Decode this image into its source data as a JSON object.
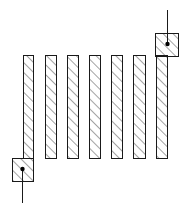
{
  "diagram": {
    "type": "interdigitated-resistor-layout",
    "colors": {
      "stroke": "#1a1a1a",
      "hatch": "#333333",
      "background": "#ffffff"
    },
    "bars": [
      {
        "x": 23,
        "y": 55,
        "w": 10,
        "h": 103
      },
      {
        "x": 45,
        "y": 55,
        "w": 11,
        "h": 103
      },
      {
        "x": 67,
        "y": 55,
        "w": 11,
        "h": 103
      },
      {
        "x": 89,
        "y": 55,
        "w": 11,
        "h": 103
      },
      {
        "x": 111,
        "y": 55,
        "w": 11,
        "h": 103
      },
      {
        "x": 133,
        "y": 55,
        "w": 12,
        "h": 103
      },
      {
        "x": 156,
        "y": 55,
        "w": 11,
        "h": 103
      }
    ],
    "terminals": [
      {
        "name": "left-bottom",
        "pad": {
          "x": 12,
          "y": 158,
          "w": 21,
          "h": 23
        },
        "dot": {
          "cx": 22,
          "cy": 169
        },
        "lead": {
          "x1": 22,
          "y1": 169,
          "x2": 22,
          "y2": 203
        }
      },
      {
        "name": "right-top",
        "pad": {
          "x": 155,
          "y": 33,
          "w": 23,
          "h": 23
        },
        "dot": {
          "cx": 167,
          "cy": 44
        },
        "lead": {
          "x1": 167,
          "y1": 10,
          "x2": 167,
          "y2": 44
        }
      }
    ]
  }
}
